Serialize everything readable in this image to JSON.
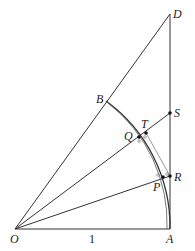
{
  "diagram": {
    "type": "geometry",
    "colors": {
      "line": "#333333",
      "arc_gray": "#999999",
      "point": "#111111"
    },
    "points": {
      "O": {
        "label": "O",
        "x": 15,
        "y": 229
      },
      "A": {
        "label": "A",
        "x": 170,
        "y": 229
      },
      "D": {
        "label": "D",
        "x": 170,
        "y": 14
      },
      "B": {
        "label": "B",
        "x": 106,
        "y": 101
      },
      "S": {
        "label": "S",
        "x": 170,
        "y": 113
      },
      "R": {
        "label": "R",
        "x": 170,
        "y": 176
      },
      "P": {
        "label": "P",
        "x": 163,
        "y": 177
      },
      "Q": {
        "label": "Q",
        "x": 139,
        "y": 137
      },
      "T": {
        "label": "T",
        "x": 146,
        "y": 133
      }
    },
    "segment_label": "1"
  }
}
